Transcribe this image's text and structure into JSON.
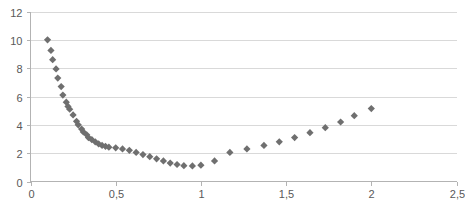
{
  "chart_data": {
    "type": "scatter",
    "title": "",
    "subtitle": "",
    "xlabel": "",
    "ylabel": "",
    "xlim": [
      0,
      2.5
    ],
    "ylim": [
      0,
      12
    ],
    "grid": true,
    "legend": false,
    "legend_position": "none",
    "marker": {
      "shape": "diamond",
      "color": "#6f6f6f",
      "size_px": 6
    },
    "axis": {
      "x_ticks": [
        0,
        0.5,
        1,
        1.5,
        2,
        2.5
      ],
      "x_tick_labels": [
        "0",
        "0,5",
        "1",
        "1,5",
        "2",
        "2,5"
      ],
      "y_ticks": [
        0,
        2,
        4,
        6,
        8,
        10,
        12
      ],
      "y_tick_labels": [
        "0",
        "2",
        "4",
        "6",
        "8",
        "10",
        "12"
      ],
      "decimal_separator": ","
    },
    "series": [
      {
        "name": "series-1",
        "color": "#6f6f6f",
        "points": [
          {
            "x": 0.1,
            "y": 10.0
          },
          {
            "x": 0.12,
            "y": 9.25
          },
          {
            "x": 0.13,
            "y": 8.6
          },
          {
            "x": 0.15,
            "y": 7.95
          },
          {
            "x": 0.16,
            "y": 7.3
          },
          {
            "x": 0.18,
            "y": 6.7
          },
          {
            "x": 0.19,
            "y": 6.1
          },
          {
            "x": 0.21,
            "y": 5.6
          },
          {
            "x": 0.22,
            "y": 5.3
          },
          {
            "x": 0.23,
            "y": 5.1
          },
          {
            "x": 0.25,
            "y": 4.7
          },
          {
            "x": 0.27,
            "y": 4.25
          },
          {
            "x": 0.28,
            "y": 4.0
          },
          {
            "x": 0.3,
            "y": 3.7
          },
          {
            "x": 0.31,
            "y": 3.5
          },
          {
            "x": 0.33,
            "y": 3.3
          },
          {
            "x": 0.34,
            "y": 3.1
          },
          {
            "x": 0.36,
            "y": 2.95
          },
          {
            "x": 0.38,
            "y": 2.8
          },
          {
            "x": 0.4,
            "y": 2.65
          },
          {
            "x": 0.42,
            "y": 2.55
          },
          {
            "x": 0.44,
            "y": 2.48
          },
          {
            "x": 0.46,
            "y": 2.42
          },
          {
            "x": 0.5,
            "y": 2.38
          },
          {
            "x": 0.54,
            "y": 2.3
          },
          {
            "x": 0.58,
            "y": 2.2
          },
          {
            "x": 0.62,
            "y": 2.05
          },
          {
            "x": 0.66,
            "y": 1.9
          },
          {
            "x": 0.7,
            "y": 1.75
          },
          {
            "x": 0.74,
            "y": 1.6
          },
          {
            "x": 0.78,
            "y": 1.45
          },
          {
            "x": 0.82,
            "y": 1.3
          },
          {
            "x": 0.86,
            "y": 1.2
          },
          {
            "x": 0.9,
            "y": 1.12
          },
          {
            "x": 0.95,
            "y": 1.1
          },
          {
            "x": 1.0,
            "y": 1.15
          },
          {
            "x": 1.08,
            "y": 1.45
          },
          {
            "x": 1.17,
            "y": 2.05
          },
          {
            "x": 1.27,
            "y": 2.3
          },
          {
            "x": 1.37,
            "y": 2.55
          },
          {
            "x": 1.46,
            "y": 2.8
          },
          {
            "x": 1.55,
            "y": 3.1
          },
          {
            "x": 1.64,
            "y": 3.45
          },
          {
            "x": 1.73,
            "y": 3.8
          },
          {
            "x": 1.82,
            "y": 4.2
          },
          {
            "x": 1.9,
            "y": 4.65
          },
          {
            "x": 2.0,
            "y": 5.15
          }
        ]
      }
    ]
  }
}
